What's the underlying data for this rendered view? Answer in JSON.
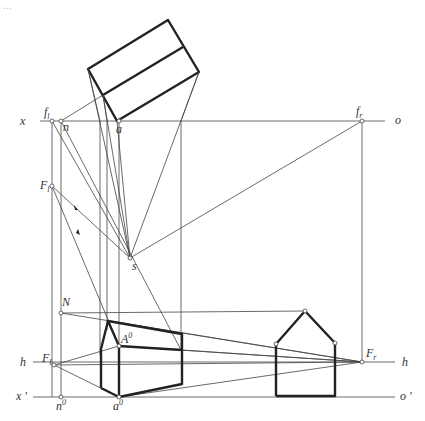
{
  "figure": {
    "caption": "…",
    "type": "perspective construction (measuring-point method)",
    "labels": {
      "x": "x",
      "o": "o",
      "h": "h",
      "x_prime": "x '",
      "o_prime": "o '",
      "f_l": "f",
      "f_l_sub": "l",
      "f_r": "f",
      "f_r_sub": "r",
      "n": "n",
      "a": "a",
      "F_l_upper": "F",
      "F_l_upper_sub": "l",
      "s": "s",
      "N": "N",
      "A0": "A",
      "A0_sup": "0",
      "F_l": "F",
      "F_l_sub": "l",
      "F_r": "F",
      "F_r_sub": "r",
      "n0": "n",
      "n0_sup": "0",
      "a0": "a",
      "a0_sup": "0"
    },
    "colors": {
      "line": "#444444",
      "thick": "#222222",
      "background": "#ffffff"
    }
  }
}
